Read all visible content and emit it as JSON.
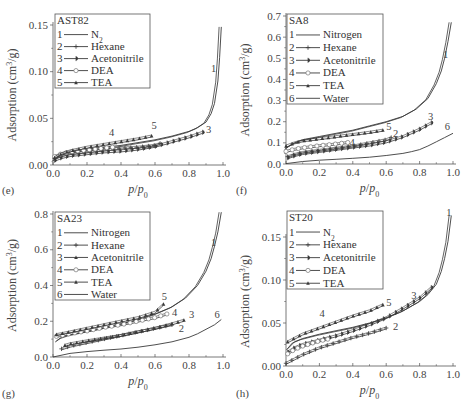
{
  "chart_data": [
    {
      "panel": "(e)",
      "type": "line",
      "title": "AST82",
      "xlabel": "p/p0",
      "ylabel": "Adsorption (cm3/g)",
      "xlim": [
        0.0,
        1.0
      ],
      "ylim": [
        0.0,
        0.15
      ],
      "xticks": [
        "0.0",
        "0.2",
        "0.4",
        "0.6",
        "0.8",
        "1.0"
      ],
      "yticks": [
        "0.00",
        "0.05",
        "0.10",
        "0.15"
      ],
      "grid": false,
      "legend_position": "upper-left",
      "series": [
        {
          "id": "1",
          "name": "N2",
          "marker": "none",
          "x": [
            0.0,
            0.05,
            0.1,
            0.2,
            0.3,
            0.4,
            0.5,
            0.6,
            0.7,
            0.8,
            0.85,
            0.9,
            0.93,
            0.95,
            0.97,
            0.98,
            0.99
          ],
          "y": [
            0.005,
            0.011,
            0.014,
            0.017,
            0.019,
            0.021,
            0.024,
            0.027,
            0.031,
            0.036,
            0.04,
            0.046,
            0.055,
            0.066,
            0.09,
            0.115,
            0.148
          ]
        },
        {
          "id": "2",
          "name": "Hexane",
          "marker": "star",
          "x": [
            0.01,
            0.05,
            0.1,
            0.2,
            0.3,
            0.4,
            0.5,
            0.6,
            0.63
          ],
          "y": [
            0.006,
            0.009,
            0.011,
            0.013,
            0.015,
            0.017,
            0.018,
            0.02,
            0.022
          ]
        },
        {
          "id": "3",
          "name": "Acetonitrile",
          "marker": "half-filled-circle",
          "x": [
            0.01,
            0.05,
            0.1,
            0.2,
            0.3,
            0.4,
            0.5,
            0.6,
            0.7,
            0.8,
            0.88
          ],
          "y": [
            0.004,
            0.007,
            0.009,
            0.011,
            0.013,
            0.014,
            0.016,
            0.019,
            0.024,
            0.029,
            0.034
          ]
        },
        {
          "id": "4",
          "name": "DEA",
          "marker": "open-circle",
          "x": [
            0.01,
            0.05,
            0.1,
            0.2,
            0.3,
            0.35
          ],
          "y": [
            0.008,
            0.011,
            0.013,
            0.015,
            0.017,
            0.018
          ]
        },
        {
          "id": "5",
          "name": "TEA",
          "marker": "filled-triangle",
          "x": [
            0.01,
            0.05,
            0.1,
            0.2,
            0.3,
            0.4,
            0.5,
            0.58
          ],
          "y": [
            0.007,
            0.011,
            0.014,
            0.018,
            0.021,
            0.024,
            0.027,
            0.03
          ]
        }
      ],
      "annotations": [
        {
          "text": "1",
          "x": 0.93,
          "y": 0.1
        },
        {
          "text": "3",
          "x": 0.9,
          "y": 0.034
        },
        {
          "text": "4",
          "x": 0.33,
          "y": 0.031
        },
        {
          "text": "5",
          "x": 0.58,
          "y": 0.039
        }
      ]
    },
    {
      "panel": "(f)",
      "type": "line",
      "title": "SA8",
      "xlabel": "p/p0",
      "ylabel": "Adsorption (cm3/g)",
      "xlim": [
        0.0,
        1.0
      ],
      "ylim": [
        0.0,
        0.7
      ],
      "xticks": [
        "0.0",
        "0.2",
        "0.4",
        "0.6",
        "0.8",
        "1.0"
      ],
      "yticks": [
        "0.0",
        "0.1",
        "0.2",
        "0.3",
        "0.4",
        "0.5",
        "0.6",
        "0.7"
      ],
      "grid": false,
      "legend_position": "upper-left",
      "series": [
        {
          "id": "1",
          "name": "Nitrogen",
          "marker": "none",
          "x": [
            0.0,
            0.05,
            0.1,
            0.2,
            0.3,
            0.4,
            0.5,
            0.6,
            0.7,
            0.78,
            0.85,
            0.9,
            0.93,
            0.95,
            0.97,
            0.99
          ],
          "y": [
            0.075,
            0.1,
            0.115,
            0.13,
            0.145,
            0.16,
            0.18,
            0.2,
            0.225,
            0.26,
            0.31,
            0.38,
            0.44,
            0.5,
            0.58,
            0.67
          ]
        },
        {
          "id": "2",
          "name": "Hexane",
          "marker": "star",
          "x": [
            0.01,
            0.05,
            0.1,
            0.2,
            0.3,
            0.4,
            0.5,
            0.6,
            0.63
          ],
          "y": [
            0.03,
            0.04,
            0.05,
            0.06,
            0.07,
            0.08,
            0.095,
            0.11,
            0.12
          ]
        },
        {
          "id": "3",
          "name": "Acetonitrile",
          "marker": "half-filled-circle",
          "x": [
            0.01,
            0.05,
            0.1,
            0.2,
            0.3,
            0.4,
            0.5,
            0.6,
            0.7,
            0.8,
            0.87
          ],
          "y": [
            0.025,
            0.035,
            0.045,
            0.055,
            0.065,
            0.075,
            0.085,
            0.1,
            0.125,
            0.16,
            0.19
          ]
        },
        {
          "id": "4",
          "name": "DEA",
          "marker": "open-circle",
          "x": [
            0.0,
            0.05,
            0.1,
            0.2,
            0.3,
            0.37
          ],
          "y": [
            0.055,
            0.065,
            0.072,
            0.082,
            0.09,
            0.097
          ]
        },
        {
          "id": "5",
          "name": "TEA",
          "marker": "filled-triangle",
          "x": [
            0.0,
            0.05,
            0.1,
            0.2,
            0.3,
            0.4,
            0.5,
            0.58
          ],
          "y": [
            0.08,
            0.095,
            0.105,
            0.115,
            0.125,
            0.135,
            0.145,
            0.155
          ]
        },
        {
          "id": "6",
          "name": "Water",
          "marker": "none",
          "x": [
            0.0,
            0.1,
            0.2,
            0.3,
            0.4,
            0.5,
            0.6,
            0.7,
            0.75,
            0.8,
            0.85,
            0.9,
            0.95,
            1.0
          ],
          "y": [
            0.002,
            0.012,
            0.018,
            0.022,
            0.027,
            0.032,
            0.04,
            0.05,
            0.058,
            0.068,
            0.085,
            0.105,
            0.125,
            0.145
          ]
        }
      ],
      "annotations": [
        {
          "text": "1",
          "x": 0.94,
          "y": 0.5
        },
        {
          "text": "2",
          "x": 0.64,
          "y": 0.13
        },
        {
          "text": "3",
          "x": 0.85,
          "y": 0.21
        },
        {
          "text": "4",
          "x": 0.38,
          "y": 0.085
        },
        {
          "text": "5",
          "x": 0.6,
          "y": 0.16
        },
        {
          "text": "6",
          "x": 0.95,
          "y": 0.16
        }
      ]
    },
    {
      "panel": "(g)",
      "type": "line",
      "title": "SA23",
      "xlabel": "p/p0",
      "ylabel": "Adsorption (cm3/g)",
      "xlim": [
        0.0,
        1.0
      ],
      "ylim": [
        0.0,
        0.8
      ],
      "xticks": [
        "0.0",
        "0.2",
        "0.4",
        "0.6",
        "0.8",
        "1.0"
      ],
      "yticks": [
        "0.0",
        "0.2",
        "0.4",
        "0.6",
        "0.8"
      ],
      "grid": false,
      "legend_position": "upper-left",
      "series": [
        {
          "id": "1",
          "name": "Nitrogen",
          "marker": "none",
          "x": [
            0.02,
            0.05,
            0.1,
            0.2,
            0.3,
            0.4,
            0.5,
            0.6,
            0.7,
            0.78,
            0.85,
            0.9,
            0.93,
            0.95,
            0.97,
            0.99
          ],
          "y": [
            0.09,
            0.11,
            0.125,
            0.145,
            0.165,
            0.185,
            0.21,
            0.24,
            0.28,
            0.33,
            0.4,
            0.48,
            0.55,
            0.62,
            0.7,
            0.81
          ]
        },
        {
          "id": "2",
          "name": "Hexane",
          "marker": "star",
          "x": [
            0.05,
            0.1,
            0.2,
            0.3,
            0.4,
            0.5,
            0.6,
            0.7
          ],
          "y": [
            0.04,
            0.055,
            0.075,
            0.095,
            0.115,
            0.135,
            0.155,
            0.175
          ]
        },
        {
          "id": "3",
          "name": "Acetonitrile",
          "marker": "filled-triangle",
          "x": [
            0.07,
            0.1,
            0.2,
            0.3,
            0.4,
            0.5,
            0.6,
            0.7,
            0.77
          ],
          "y": [
            0.06,
            0.068,
            0.085,
            0.1,
            0.115,
            0.135,
            0.155,
            0.18,
            0.2
          ]
        },
        {
          "id": "4",
          "name": "DEA",
          "marker": "open-circle",
          "x": [
            0.02,
            0.05,
            0.1,
            0.2,
            0.3,
            0.4,
            0.5,
            0.6,
            0.67
          ],
          "y": [
            0.11,
            0.115,
            0.125,
            0.14,
            0.16,
            0.175,
            0.195,
            0.215,
            0.235
          ]
        },
        {
          "id": "5",
          "name": "TEA",
          "marker": "filled-triangle",
          "x": [
            0.02,
            0.05,
            0.1,
            0.2,
            0.3,
            0.4,
            0.5,
            0.6,
            0.65
          ],
          "y": [
            0.12,
            0.125,
            0.135,
            0.155,
            0.175,
            0.195,
            0.215,
            0.245,
            0.29
          ]
        },
        {
          "id": "6",
          "name": "Water",
          "marker": "none",
          "x": [
            0.0,
            0.1,
            0.2,
            0.3,
            0.4,
            0.5,
            0.6,
            0.7,
            0.8,
            0.85,
            0.9,
            0.95,
            0.99
          ],
          "y": [
            0.0,
            0.02,
            0.03,
            0.038,
            0.045,
            0.055,
            0.068,
            0.085,
            0.11,
            0.13,
            0.155,
            0.18,
            0.21
          ]
        }
      ],
      "annotations": [
        {
          "text": "1",
          "x": 0.93,
          "y": 0.62
        },
        {
          "text": "2",
          "x": 0.74,
          "y": 0.14
        },
        {
          "text": "3",
          "x": 0.8,
          "y": 0.22
        },
        {
          "text": "4",
          "x": 0.7,
          "y": 0.23
        },
        {
          "text": "5",
          "x": 0.64,
          "y": 0.32
        },
        {
          "text": "6",
          "x": 0.95,
          "y": 0.22
        }
      ]
    },
    {
      "panel": "(h)",
      "type": "line",
      "title": "ST20",
      "xlabel": "p/p0",
      "ylabel": "Adsorption (cm3/g)",
      "xlim": [
        0.0,
        1.0
      ],
      "ylim": [
        0.0,
        0.15
      ],
      "xticks": [
        "0.0",
        "0.2",
        "0.4",
        "0.6",
        "0.8",
        "1.0"
      ],
      "yticks": [
        "0.00",
        "0.05",
        "0.10",
        "0.15"
      ],
      "grid": false,
      "legend_position": "upper-left",
      "series": [
        {
          "id": "1",
          "name": "N2",
          "marker": "none",
          "x": [
            0.01,
            0.05,
            0.1,
            0.2,
            0.3,
            0.4,
            0.5,
            0.6,
            0.7,
            0.8,
            0.85,
            0.9,
            0.93,
            0.95,
            0.97,
            0.99
          ],
          "y": [
            0.02,
            0.028,
            0.032,
            0.037,
            0.041,
            0.045,
            0.05,
            0.056,
            0.064,
            0.075,
            0.083,
            0.095,
            0.11,
            0.125,
            0.145,
            0.175
          ]
        },
        {
          "id": "2",
          "name": "Hexane",
          "marker": "star",
          "x": [
            0.0,
            0.05,
            0.1,
            0.2,
            0.3,
            0.4,
            0.5,
            0.6
          ],
          "y": [
            0.002,
            0.007,
            0.012,
            0.02,
            0.026,
            0.032,
            0.037,
            0.043
          ]
        },
        {
          "id": "3",
          "name": "Acetonitrile",
          "marker": "half-filled-circle",
          "x": [
            0.01,
            0.05,
            0.1,
            0.2,
            0.3,
            0.4,
            0.5,
            0.6,
            0.7,
            0.8,
            0.87
          ],
          "y": [
            0.015,
            0.02,
            0.024,
            0.029,
            0.034,
            0.04,
            0.047,
            0.055,
            0.066,
            0.078,
            0.09
          ]
        },
        {
          "id": "4",
          "name": "DEA",
          "marker": "open-circle",
          "x": [
            0.01,
            0.05,
            0.1,
            0.2,
            0.25
          ],
          "y": [
            0.013,
            0.018,
            0.022,
            0.028,
            0.03
          ]
        },
        {
          "id": "5",
          "name": "TEA",
          "marker": "filled-triangle",
          "x": [
            0.01,
            0.05,
            0.1,
            0.2,
            0.3,
            0.4,
            0.5,
            0.58
          ],
          "y": [
            0.027,
            0.031,
            0.036,
            0.043,
            0.05,
            0.057,
            0.063,
            0.07
          ]
        }
      ],
      "annotations": [
        {
          "text": "1",
          "x": 0.96,
          "y": 0.175
        },
        {
          "text": "2",
          "x": 0.64,
          "y": 0.042
        },
        {
          "text": "3",
          "x": 0.75,
          "y": 0.078
        },
        {
          "text": "4",
          "x": 0.2,
          "y": 0.057
        },
        {
          "text": "5",
          "x": 0.6,
          "y": 0.07
        }
      ]
    }
  ],
  "panels": [
    {
      "letter": "(e)",
      "title": "AST82",
      "xlabel": "p/p0",
      "ylabel": "Adsorption (cm3/g)"
    },
    {
      "letter": "(f)",
      "title": "SA8",
      "xlabel": "p/p0",
      "ylabel": "Adsorption (cm3/g)"
    },
    {
      "letter": "(g)",
      "title": "SA23",
      "xlabel": "p/p0",
      "ylabel": "Adsorption (cm3/g)"
    },
    {
      "letter": "(h)",
      "title": "ST20",
      "xlabel": "p/p0",
      "ylabel": "Adsorption (cm3/g)"
    }
  ],
  "layout": {
    "frames": [
      {
        "x0": 53,
        "x1": 223,
        "y0": 165,
        "ytop": 25
      },
      {
        "x0": 286,
        "x1": 453,
        "y0": 164,
        "ytop": 16
      },
      {
        "x0": 53,
        "x1": 223,
        "y0": 357,
        "ytop": 214
      },
      {
        "x0": 286,
        "x1": 453,
        "y0": 366,
        "ytop": 237
      }
    ],
    "legends": [
      {
        "x": 55,
        "y": 14,
        "w": 95,
        "h": 74
      },
      {
        "x": 287,
        "y": 14,
        "w": 96,
        "h": 90
      },
      {
        "x": 55,
        "y": 212,
        "w": 95,
        "h": 88
      },
      {
        "x": 287,
        "y": 211,
        "w": 96,
        "h": 78
      }
    ],
    "letters": [
      {
        "x": 2,
        "y": 194
      },
      {
        "x": 236,
        "y": 194
      },
      {
        "x": 2,
        "y": 397
      },
      {
        "x": 236,
        "y": 397
      }
    ],
    "line_color": "#3a3a3a"
  }
}
